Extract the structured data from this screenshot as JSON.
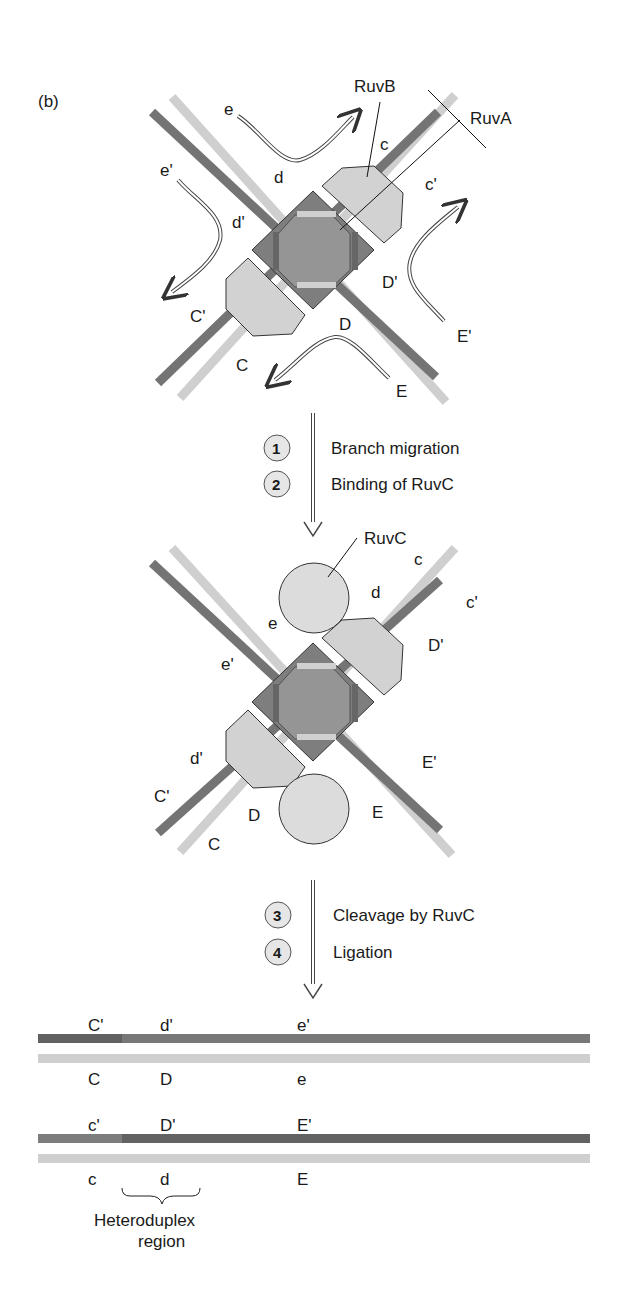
{
  "panel_label": "(b)",
  "colors": {
    "dark_strand": "#747474",
    "light_strand": "#cfcfcf",
    "ruva": "#8a8a8a",
    "ruvb": "#d2d2d2",
    "ruvc": "#dcdcdc",
    "step_circle": "#e6e6e6"
  },
  "stage1": {
    "protein_labels": {
      "ruvb": "RuvB",
      "ruva": "RuvA"
    },
    "strand_labels": {
      "e": "e",
      "e_prime": "e'",
      "d": "d",
      "d_prime": "d'",
      "c": "c",
      "c_prime": "c'",
      "C_prime": "C'",
      "C": "C",
      "D": "D",
      "D_prime": "D'",
      "E": "E",
      "E_prime": "E'"
    }
  },
  "steps_a": [
    {
      "num": "1",
      "label": "Branch migration"
    },
    {
      "num": "2",
      "label": "Binding of RuvC"
    }
  ],
  "stage2": {
    "protein_labels": {
      "ruvc": "RuvC"
    },
    "strand_labels": {
      "c": "c",
      "d": "d",
      "c_prime": "c'",
      "e": "e",
      "D_prime": "D'",
      "e_prime": "e'",
      "d_prime": "d'",
      "E_prime": "E'",
      "C_prime": "C'",
      "D": "D",
      "E": "E",
      "C": "C"
    }
  },
  "steps_b": [
    {
      "num": "3",
      "label": "Cleavage by RuvC"
    },
    {
      "num": "4",
      "label": "Ligation"
    }
  ],
  "products": {
    "duplex1": {
      "top": [
        "C'",
        "d'",
        "e'"
      ],
      "bottom": [
        "C",
        "D",
        "e"
      ]
    },
    "duplex2": {
      "top": [
        "c'",
        "D'",
        "E'"
      ],
      "bottom": [
        "c",
        "d",
        "E"
      ]
    },
    "heteroduplex_line1": "Heteroduplex",
    "heteroduplex_line2": "region"
  }
}
